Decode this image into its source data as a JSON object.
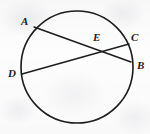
{
  "figure": {
    "kind": "circle-with-two-intersecting-chords",
    "stroke_color": "#1c1c1c",
    "background_color": "#fbfbfb",
    "circle": {
      "center_x": 77,
      "center_y": 67,
      "radius": 56,
      "stroke_width": 1.6
    },
    "chords": [
      {
        "name": "chord-ab",
        "from": "A",
        "to": "B",
        "x1": 34,
        "y1": 27,
        "x2": 131,
        "y2": 62,
        "stroke_width": 1.4
      },
      {
        "name": "chord-dc",
        "from": "D",
        "to": "C",
        "x1": 22,
        "y1": 74,
        "x2": 129,
        "y2": 44,
        "stroke_width": 1.4
      }
    ],
    "points": [
      {
        "id": "A",
        "label": "A",
        "label_x": 21,
        "label_y": 16,
        "on_circle": true
      },
      {
        "id": "C",
        "label": "C",
        "label_x": 131,
        "label_y": 32,
        "on_circle": true
      },
      {
        "id": "E",
        "label": "E",
        "label_x": 93,
        "label_y": 32,
        "on_circle": false
      },
      {
        "id": "B",
        "label": "B",
        "label_x": 137,
        "label_y": 60,
        "on_circle": true
      },
      {
        "id": "D",
        "label": "D",
        "label_x": 8,
        "label_y": 68,
        "on_circle": true
      }
    ],
    "intersection": {
      "id": "E",
      "x": 98,
      "y": 49
    }
  }
}
